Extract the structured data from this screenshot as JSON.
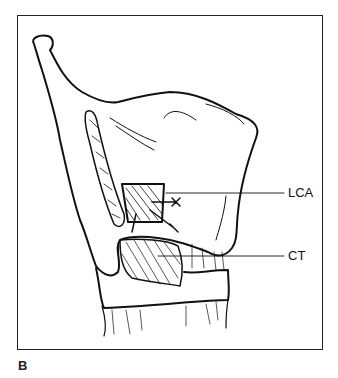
{
  "figure": {
    "panel_label": "B",
    "labels": [
      {
        "id": "lca",
        "text": "LCA"
      },
      {
        "id": "ct",
        "text": "CT"
      }
    ]
  }
}
